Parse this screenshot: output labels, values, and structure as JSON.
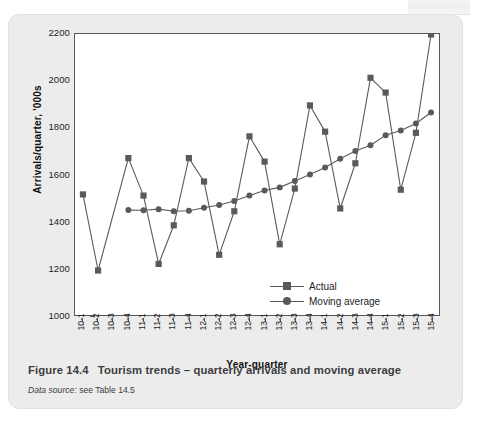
{
  "figure": {
    "caption_number": "Figure 14.4",
    "caption_title": "Tourism trends – quarterly arrivals and moving average",
    "source_label": "Data source:",
    "source_value": "see Table 14.5"
  },
  "legend": {
    "position": "inside-bottom-right",
    "entries": [
      {
        "label": "Actual",
        "marker": "square",
        "color": "#5a5a5c"
      },
      {
        "label": "Moving average",
        "marker": "circle",
        "color": "#5a5a5c"
      }
    ]
  },
  "chart_data": {
    "type": "line",
    "title": "",
    "xlabel": "Year-quarter",
    "ylabel": "Arrivals/quarter, '000s",
    "ylim": [
      1000,
      2200
    ],
    "ytick_values": [
      2200,
      2000,
      1800,
      1600,
      1400,
      1200,
      1000
    ],
    "ytick_labels": [
      "2200",
      "2000",
      "1800",
      "1600",
      "1400",
      "1200",
      "1000"
    ],
    "grid": false,
    "categories": [
      "10-1",
      "10-2",
      "10-3",
      "10-4",
      "11-1",
      "11-2",
      "11-3",
      "11-4",
      "12-1",
      "12-2",
      "12-3",
      "12-4",
      "13-1",
      "13-2",
      "13-3",
      "13-4",
      "14-1",
      "14-2",
      "14-3",
      "14-4",
      "15-1",
      "15-2",
      "15-3",
      "15-4"
    ],
    "series": [
      {
        "name": "Actual",
        "marker": "square",
        "color": "#5a5a5c",
        "values": [
          1515,
          1190,
          null,
          1670,
          1510,
          1218,
          1383,
          1670,
          1570,
          1257,
          1443,
          1763,
          1655,
          1302,
          1540,
          1895,
          1783,
          1455,
          1648,
          2013,
          1950,
          1535,
          1778,
          2198
        ]
      },
      {
        "name": "Moving average",
        "marker": "circle",
        "color": "#5a5a5c",
        "values": [
          null,
          null,
          null,
          1448,
          1447,
          1452,
          1443,
          1445,
          1458,
          1470,
          1487,
          1510,
          1532,
          1545,
          1572,
          1600,
          1630,
          1667,
          1700,
          1725,
          1768,
          1788,
          1818,
          1865
        ]
      }
    ]
  }
}
